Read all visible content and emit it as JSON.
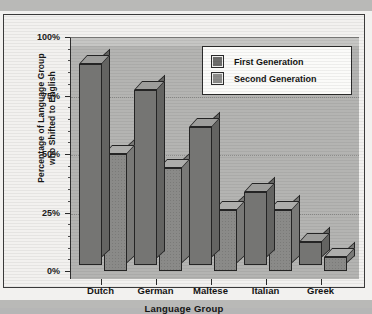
{
  "chart_data": {
    "type": "bar",
    "title": "",
    "xlabel": "Language Group",
    "ylabel": "Percentage of Language Group who Shifted to English",
    "ylabel_line1": "Percentage of Language Group",
    "ylabel_line2": "who Shifted to English",
    "categories": [
      "Dutch",
      "German",
      "Maltese",
      "Italian",
      "Greek"
    ],
    "series": [
      {
        "name": "First Generation",
        "values": [
          86,
          75,
          59,
          31,
          10
        ],
        "color": "#757573"
      },
      {
        "name": "Second Generation",
        "values": [
          50,
          44,
          26,
          26,
          6
        ],
        "color": "#8a8a88"
      }
    ],
    "ylim": [
      0,
      100
    ],
    "ytick_labels": [
      "0%",
      "25%",
      "50%",
      "75%",
      "100%"
    ],
    "ytick_values": [
      0,
      25,
      50,
      75,
      100
    ],
    "grid": true,
    "grid_axis": "y",
    "legend_position": "top-right",
    "style": "3d-bar"
  },
  "legend": {
    "items": [
      {
        "label": "First Generation"
      },
      {
        "label": "Second Generation"
      }
    ]
  }
}
